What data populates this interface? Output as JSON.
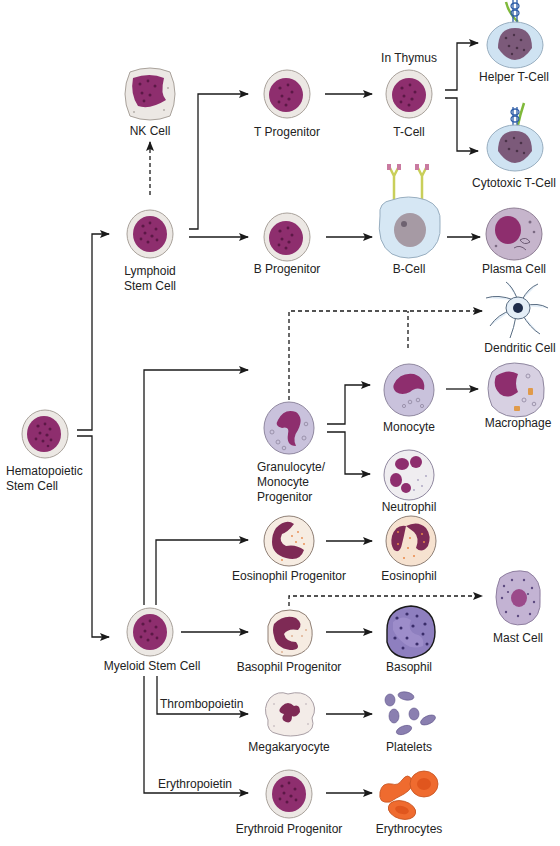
{
  "diagram": {
    "colors": {
      "nucleus": "#8e2e6e",
      "nucleus_dark": "#6e1f55",
      "cytoplasm": "#ece8e4",
      "rim": "#b9b3ad",
      "t_cell_cytoplasm": "#cfe3f2",
      "monocyte_cytoplasm": "#c9c2dc",
      "eosinophil_granule": "#e8884a",
      "basophil_body": "#7b6aaa",
      "platelet": "#8a7fb0",
      "erythrocyte": "#ef6b2f",
      "receptor_blue": "#2e5ea8",
      "receptor_green": "#7fb93a",
      "antibody_yellow": "#c9cf5a",
      "antibody_pink": "#c97aa0",
      "arrow": "#1a1a1a"
    },
    "nodes": {
      "hsc": {
        "label_line1": "Hematopoietic",
        "label_line2": "Stem Cell"
      },
      "lymphoid": {
        "label_line1": "Lymphoid",
        "label_line2": "Stem Cell"
      },
      "nk": {
        "label": "NK Cell"
      },
      "t_progenitor": {
        "label": "T Progenitor"
      },
      "t_cell": {
        "label": "T-Cell",
        "annotation": "In Thymus"
      },
      "helper_t": {
        "label": "Helper T-Cell"
      },
      "cytotoxic_t": {
        "label": "Cytotoxic T-Cell"
      },
      "b_progenitor": {
        "label": "B Progenitor"
      },
      "b_cell": {
        "label": "B-Cell"
      },
      "plasma": {
        "label": "Plasma Cell"
      },
      "dendritic": {
        "label": "Dendritic Cell"
      },
      "gm_progenitor": {
        "label_line1": "Granulocyte/",
        "label_line2": "Monocyte",
        "label_line3": "Progenitor"
      },
      "monocyte": {
        "label": "Monocyte"
      },
      "macrophage": {
        "label": "Macrophage"
      },
      "neutrophil": {
        "label": "Neutrophil"
      },
      "eos_progenitor": {
        "label": "Eosinophil Progenitor"
      },
      "eosinophil": {
        "label": "Eosinophil"
      },
      "myeloid": {
        "label": "Myeloid Stem Cell"
      },
      "baso_progenitor": {
        "label": "Basophil Progenitor"
      },
      "basophil": {
        "label": "Basophil"
      },
      "mast": {
        "label": "Mast Cell"
      },
      "megakaryocyte": {
        "label": "Megakaryocyte"
      },
      "platelets": {
        "label": "Platelets"
      },
      "erythroid_progenitor": {
        "label": "Erythroid Progenitor"
      },
      "erythrocytes": {
        "label": "Erythrocytes"
      }
    },
    "edge_labels": {
      "thrombopoietin": "Thrombopoietin",
      "erythropoietin": "Erythropoietin"
    },
    "edges": [
      {
        "from": "Hematopoietic Stem Cell",
        "to": "Lymphoid Stem Cell",
        "style": "solid"
      },
      {
        "from": "Hematopoietic Stem Cell",
        "to": "Myeloid Stem Cell",
        "style": "solid"
      },
      {
        "from": "Lymphoid Stem Cell",
        "to": "NK Cell",
        "style": "dashed"
      },
      {
        "from": "Lymphoid Stem Cell",
        "to": "T Progenitor",
        "style": "solid"
      },
      {
        "from": "Lymphoid Stem Cell",
        "to": "B Progenitor",
        "style": "solid"
      },
      {
        "from": "T Progenitor",
        "to": "T-Cell",
        "style": "solid"
      },
      {
        "from": "T-Cell",
        "to": "Helper T-Cell",
        "style": "solid"
      },
      {
        "from": "T-Cell",
        "to": "Cytotoxic T-Cell",
        "style": "solid"
      },
      {
        "from": "B Progenitor",
        "to": "B-Cell",
        "style": "solid"
      },
      {
        "from": "B-Cell",
        "to": "Plasma Cell",
        "style": "solid"
      },
      {
        "from": "Granulocyte/Monocyte Progenitor",
        "to": "Dendritic Cell",
        "style": "dashed"
      },
      {
        "from": "Monocyte",
        "to": "Dendritic Cell",
        "style": "dashed"
      },
      {
        "from": "Myeloid Stem Cell",
        "to": "Granulocyte/Monocyte Progenitor",
        "style": "solid"
      },
      {
        "from": "Granulocyte/Monocyte Progenitor",
        "to": "Monocyte",
        "style": "solid"
      },
      {
        "from": "Granulocyte/Monocyte Progenitor",
        "to": "Neutrophil",
        "style": "solid"
      },
      {
        "from": "Monocyte",
        "to": "Macrophage",
        "style": "solid"
      },
      {
        "from": "Myeloid Stem Cell",
        "to": "Eosinophil Progenitor",
        "style": "solid"
      },
      {
        "from": "Eosinophil Progenitor",
        "to": "Eosinophil",
        "style": "solid"
      },
      {
        "from": "Myeloid Stem Cell",
        "to": "Basophil Progenitor",
        "style": "solid"
      },
      {
        "from": "Basophil Progenitor",
        "to": "Basophil",
        "style": "solid"
      },
      {
        "from": "Basophil Progenitor",
        "to": "Mast Cell",
        "style": "dashed"
      },
      {
        "from": "Myeloid Stem Cell",
        "to": "Megakaryocyte",
        "style": "solid",
        "label": "Thrombopoietin"
      },
      {
        "from": "Megakaryocyte",
        "to": "Platelets",
        "style": "solid"
      },
      {
        "from": "Myeloid Stem Cell",
        "to": "Erythroid Progenitor",
        "style": "solid",
        "label": "Erythropoietin"
      },
      {
        "from": "Erythroid Progenitor",
        "to": "Erythrocytes",
        "style": "solid"
      }
    ]
  }
}
